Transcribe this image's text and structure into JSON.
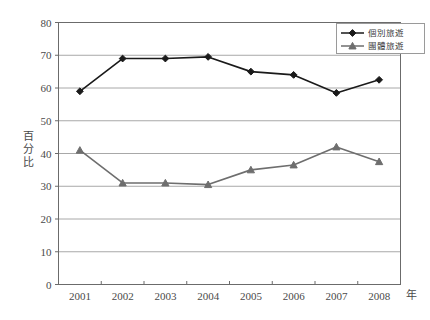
{
  "chart_data": {
    "type": "line",
    "title": "",
    "subtitle": "",
    "xlabel": "年",
    "ylabel": "百分比",
    "categories": [
      "2001",
      "2002",
      "2003",
      "2004",
      "2005",
      "2006",
      "2007",
      "2008"
    ],
    "x": [
      2001,
      2002,
      2003,
      2004,
      2005,
      2006,
      2007,
      2008
    ],
    "ylim": [
      0,
      80
    ],
    "ytick_step": 10,
    "yticks": [
      "0",
      "10",
      "20",
      "30",
      "40",
      "50",
      "60",
      "70",
      "80"
    ],
    "grid": true,
    "grid_axis": "y",
    "legend_position": "top-right",
    "series": [
      {
        "name": "個別旅遊",
        "color": "#1a1a1a",
        "marker": "diamond",
        "values": [
          59,
          69,
          69,
          69.5,
          65,
          64,
          58.5,
          62.5
        ]
      },
      {
        "name": "團體旅遊",
        "color": "#6e6e6e",
        "marker": "triangle",
        "values": [
          41,
          31,
          31,
          30.5,
          35,
          36.5,
          42,
          37.5
        ]
      }
    ]
  },
  "legend": {
    "items": [
      {
        "label": "個別旅遊"
      },
      {
        "label": "團體旅遊"
      }
    ]
  },
  "axes": {
    "y_axis_title": "百分比",
    "y_axis_title_chars": [
      "百",
      "分",
      "比"
    ],
    "x_axis_title": "年"
  },
  "colors": {
    "series_individual": "#1a1a1a",
    "series_group": "#6e6e6e",
    "gridline": "#a8a8a8",
    "frame": "#6b6b6b",
    "text": "#4a4a4a",
    "background": "#ffffff"
  }
}
